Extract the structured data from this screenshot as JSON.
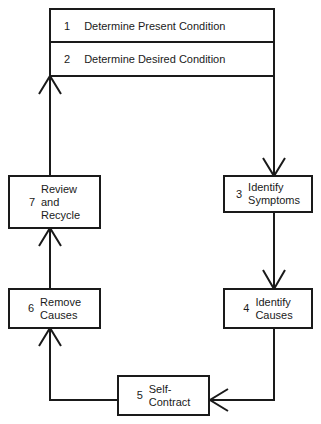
{
  "diagram": {
    "type": "process-cycle",
    "steps": [
      {
        "num": "1",
        "label": "Determine Present Condition"
      },
      {
        "num": "2",
        "label": "Determine Desired Condition"
      },
      {
        "num": "3",
        "line1": "Identify",
        "line2": "Symptoms"
      },
      {
        "num": "4",
        "line1": "Identify",
        "line2": "Causes"
      },
      {
        "num": "5",
        "line1": "Self-",
        "line2": "Contract"
      },
      {
        "num": "6",
        "line1": "Remove",
        "line2": "Causes"
      },
      {
        "num": "7",
        "line1": "Review",
        "line2": "and",
        "line3": "Recycle"
      }
    ],
    "flow": [
      "1-2 -> 3",
      "3 -> 4",
      "4 -> 5",
      "5 -> 6",
      "6 -> 7",
      "7 -> 1-2"
    ],
    "colors": {
      "stroke": "#1a1a1a",
      "background": "#ffffff"
    }
  }
}
